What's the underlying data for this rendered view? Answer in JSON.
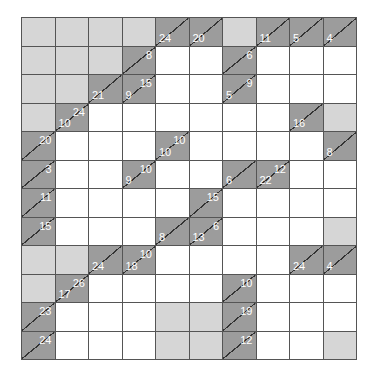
{
  "puzzle": {
    "type": "kakuro",
    "rows": 12,
    "cols": 10,
    "colors": {
      "clue": "#9c9c9c",
      "blank": "#d6d6d6",
      "white": "#ffffff",
      "grid_line": "#555555",
      "clue_text": "#ffffff"
    },
    "grid": [
      [
        {
          "t": "b"
        },
        {
          "t": "b"
        },
        {
          "t": "b"
        },
        {
          "t": "b"
        },
        {
          "t": "c",
          "d": "24"
        },
        {
          "t": "c",
          "d": "20"
        },
        {
          "t": "b"
        },
        {
          "t": "c",
          "d": "11"
        },
        {
          "t": "c",
          "d": "5"
        },
        {
          "t": "c",
          "d": "4"
        }
      ],
      [
        {
          "t": "b"
        },
        {
          "t": "b"
        },
        {
          "t": "b"
        },
        {
          "t": "c",
          "r": "8"
        },
        {
          "t": "w"
        },
        {
          "t": "w"
        },
        {
          "t": "c",
          "r": "6"
        },
        {
          "t": "w"
        },
        {
          "t": "w"
        },
        {
          "t": "w"
        }
      ],
      [
        {
          "t": "b"
        },
        {
          "t": "b"
        },
        {
          "t": "c",
          "d": "21"
        },
        {
          "t": "c",
          "r": "15",
          "d": "9"
        },
        {
          "t": "w"
        },
        {
          "t": "w"
        },
        {
          "t": "c",
          "r": "9",
          "d": "5"
        },
        {
          "t": "w"
        },
        {
          "t": "w"
        },
        {
          "t": "w"
        }
      ],
      [
        {
          "t": "b"
        },
        {
          "t": "c",
          "r": "24",
          "d": "10"
        },
        {
          "t": "w"
        },
        {
          "t": "w"
        },
        {
          "t": "w"
        },
        {
          "t": "w"
        },
        {
          "t": "w"
        },
        {
          "t": "w"
        },
        {
          "t": "c",
          "d": "16"
        },
        {
          "t": "b"
        }
      ],
      [
        {
          "t": "c",
          "r": "20"
        },
        {
          "t": "w"
        },
        {
          "t": "w"
        },
        {
          "t": "w"
        },
        {
          "t": "c",
          "r": "10",
          "d": "10"
        },
        {
          "t": "w"
        },
        {
          "t": "w"
        },
        {
          "t": "w"
        },
        {
          "t": "w"
        },
        {
          "t": "c",
          "d": "8"
        }
      ],
      [
        {
          "t": "c",
          "r": "3"
        },
        {
          "t": "w"
        },
        {
          "t": "w"
        },
        {
          "t": "c",
          "r": "10",
          "d": "9"
        },
        {
          "t": "w"
        },
        {
          "t": "w"
        },
        {
          "t": "c",
          "d": "6"
        },
        {
          "t": "c",
          "r": "12",
          "d": "22"
        },
        {
          "t": "w"
        },
        {
          "t": "w"
        }
      ],
      [
        {
          "t": "c",
          "r": "11"
        },
        {
          "t": "w"
        },
        {
          "t": "w"
        },
        {
          "t": "w"
        },
        {
          "t": "w"
        },
        {
          "t": "c",
          "r": "15"
        },
        {
          "t": "w"
        },
        {
          "t": "w"
        },
        {
          "t": "w"
        },
        {
          "t": "w"
        }
      ],
      [
        {
          "t": "c",
          "r": "15"
        },
        {
          "t": "w"
        },
        {
          "t": "w"
        },
        {
          "t": "w"
        },
        {
          "t": "c",
          "d": "8"
        },
        {
          "t": "c",
          "r": "6",
          "d": "13"
        },
        {
          "t": "w"
        },
        {
          "t": "w"
        },
        {
          "t": "w"
        },
        {
          "t": "b"
        }
      ],
      [
        {
          "t": "b"
        },
        {
          "t": "b"
        },
        {
          "t": "c",
          "d": "24"
        },
        {
          "t": "c",
          "r": "10",
          "d": "18"
        },
        {
          "t": "w"
        },
        {
          "t": "w"
        },
        {
          "t": "w"
        },
        {
          "t": "w"
        },
        {
          "t": "c",
          "d": "24"
        },
        {
          "t": "c",
          "d": "4"
        }
      ],
      [
        {
          "t": "b"
        },
        {
          "t": "c",
          "r": "26",
          "d": "17"
        },
        {
          "t": "w"
        },
        {
          "t": "w"
        },
        {
          "t": "w"
        },
        {
          "t": "w"
        },
        {
          "t": "c",
          "r": "10"
        },
        {
          "t": "w"
        },
        {
          "t": "w"
        },
        {
          "t": "w"
        }
      ],
      [
        {
          "t": "c",
          "r": "23"
        },
        {
          "t": "w"
        },
        {
          "t": "w"
        },
        {
          "t": "w"
        },
        {
          "t": "b"
        },
        {
          "t": "b"
        },
        {
          "t": "c",
          "r": "19"
        },
        {
          "t": "w"
        },
        {
          "t": "w"
        },
        {
          "t": "w"
        }
      ],
      [
        {
          "t": "c",
          "r": "24"
        },
        {
          "t": "w"
        },
        {
          "t": "w"
        },
        {
          "t": "w"
        },
        {
          "t": "b"
        },
        {
          "t": "b"
        },
        {
          "t": "c",
          "r": "12"
        },
        {
          "t": "w"
        },
        {
          "t": "w"
        },
        {
          "t": "b"
        }
      ]
    ]
  }
}
